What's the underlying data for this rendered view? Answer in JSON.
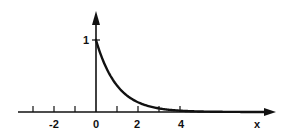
{
  "chart_data": {
    "type": "line",
    "title": "",
    "xlabel": "x",
    "ylabel": "",
    "function": "f(x) = e^(-x) for x >= 0, 0 for x < 0",
    "xlim": [
      -3.7,
      8.5
    ],
    "ylim": [
      0,
      1.35
    ],
    "x_ticks": [
      -3,
      -2,
      -1,
      0,
      1,
      2,
      3,
      4
    ],
    "x_tick_labels": [
      {
        "value": -2,
        "label": "-2"
      },
      {
        "value": 0,
        "label": "0"
      },
      {
        "value": 2,
        "label": "2"
      },
      {
        "value": 4,
        "label": "4"
      }
    ],
    "y_ticks": [
      1
    ],
    "y_tick_labels": [
      {
        "value": 1,
        "label": "1"
      }
    ],
    "grid": false,
    "legend": null,
    "series": [
      {
        "name": "f(x)",
        "x": [
          -3.7,
          0,
          0,
          0.25,
          0.5,
          0.75,
          1,
          1.5,
          2,
          2.5,
          3,
          3.5,
          4,
          5,
          6,
          7,
          8
        ],
        "y": [
          0,
          0,
          1,
          0.779,
          0.607,
          0.472,
          0.368,
          0.223,
          0.135,
          0.082,
          0.05,
          0.03,
          0.018,
          0.007,
          0.002,
          0.001,
          0.0003
        ]
      }
    ]
  },
  "labels": {
    "x_axis": "x",
    "y_one": "1",
    "t_m2": "-2",
    "t_0": "0",
    "t_2": "2",
    "t_4": "4"
  }
}
